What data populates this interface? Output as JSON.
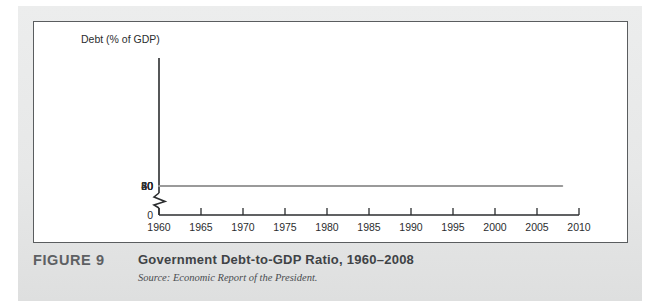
{
  "figure": {
    "number_label": "FIGURE 9",
    "title": "Government Debt-to-GDP Ratio, 1960–2008",
    "source": "Source: Economic Report of the President."
  },
  "colors": {
    "line": "#9a9a9a",
    "axis": "#2b2d2f",
    "panel_background": "#ffffff",
    "page_background": "#e9eaea",
    "panel_border": "#5a5d5f",
    "caption_title": "#3f4346",
    "figure_number": "#5d6063"
  },
  "chart_data": {
    "type": "line",
    "title": "Government Debt-to-GDP Ratio, 1960–2008",
    "xlabel": "",
    "ylabel": "Debt (% of GDP)",
    "axis_title": "Debt (% of GDP)",
    "xlim": [
      1960,
      2010
    ],
    "ylim": [
      0,
      60
    ],
    "y_axis_break": true,
    "y_break_between": [
      0,
      20
    ],
    "grid": false,
    "legend": "none",
    "xticks": [
      1960,
      1965,
      1970,
      1975,
      1980,
      1985,
      1990,
      1995,
      2000,
      2005,
      2010
    ],
    "xtick_labels": [
      "1960",
      "1965",
      "1970",
      "1975",
      "1980",
      "1985",
      "1990",
      "1995",
      "2000",
      "2005",
      "2010"
    ],
    "yticks": [
      0,
      20,
      30,
      40,
      50,
      60
    ],
    "ytick_labels": [
      "0",
      "20",
      "30",
      "40",
      "50",
      "60"
    ],
    "series": [
      {
        "name": "Debt (% of GDP)",
        "color": "#9a9a9a",
        "x": [
          1960,
          1961,
          1962,
          1963,
          1964,
          1965,
          1966,
          1967,
          1968,
          1969,
          1970,
          1971,
          1972,
          1973,
          1974,
          1975,
          1976,
          1977,
          1978,
          1979,
          1980,
          1981,
          1982,
          1983,
          1984,
          1985,
          1986,
          1987,
          1988,
          1989,
          1990,
          1991,
          1992,
          1993,
          1994,
          1995,
          1996,
          1997,
          1998,
          1999,
          2000,
          2001,
          2002,
          2003,
          2004,
          2005,
          2006,
          2007,
          2008
        ],
        "values": [
          46.5,
          46.0,
          45.3,
          44.6,
          43.5,
          41.5,
          39.3,
          37.6,
          36.2,
          34.3,
          34.8,
          32.8,
          31.2,
          29.2,
          27.0,
          25.3,
          26.8,
          27.9,
          27.6,
          26.7,
          26.4,
          26.1,
          27.4,
          31.4,
          33.5,
          35.6,
          38.7,
          40.8,
          41.0,
          41.0,
          42.9,
          45.9,
          48.8,
          51.8,
          51.4,
          49.8,
          49.0,
          47.4,
          45.3,
          42.3,
          38.5,
          34.3,
          33.3,
          34.8,
          36.5,
          37.0,
          37.1,
          37.2,
          38.3
        ]
      }
    ]
  }
}
